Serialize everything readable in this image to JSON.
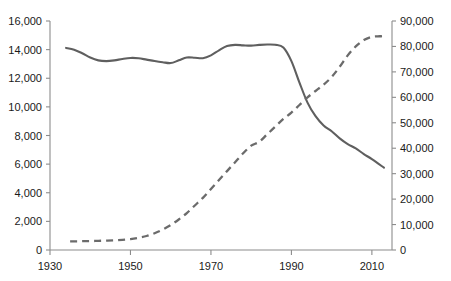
{
  "chart_data": {
    "type": "line",
    "title": "",
    "subtitle": "",
    "xlabel": "",
    "ylabel": "",
    "grid": false,
    "legend": "none",
    "xlim": [
      1930,
      2015
    ],
    "x_ticks": [
      "1930",
      "1950",
      "1970",
      "1990",
      "2010"
    ],
    "x_tick_values": [
      1930,
      1950,
      1970,
      1990,
      2010
    ],
    "axes": {
      "left": {
        "label": "",
        "ylim": [
          0,
          16000
        ],
        "ticks": [
          "0",
          "2,000",
          "4,000",
          "6,000",
          "8,000",
          "10,000",
          "12,000",
          "14,000",
          "16,000"
        ],
        "tick_values": [
          0,
          2000,
          4000,
          6000,
          8000,
          10000,
          12000,
          14000,
          16000
        ]
      },
      "right": {
        "label": "",
        "ylim": [
          0,
          90000
        ],
        "ticks": [
          "0",
          "10,000",
          "20,000",
          "30,000",
          "40,000",
          "50,000",
          "60,000",
          "70,000",
          "80,000",
          "90,000"
        ],
        "tick_values": [
          0,
          10000,
          20000,
          30000,
          40000,
          50000,
          60000,
          70000,
          80000,
          90000
        ]
      }
    },
    "series": [
      {
        "name": "solid-series",
        "style": "solid",
        "axis": "left",
        "color": "#5f5f5f",
        "x": [
          1934,
          1936,
          1938,
          1940,
          1942,
          1944,
          1946,
          1948,
          1950,
          1952,
          1954,
          1956,
          1958,
          1960,
          1962,
          1964,
          1966,
          1968,
          1970,
          1972,
          1974,
          1976,
          1978,
          1980,
          1982,
          1984,
          1986,
          1988,
          1990,
          1992,
          1994,
          1996,
          1998,
          2000,
          2002,
          2004,
          2006,
          2008,
          2010,
          2013
        ],
        "values": [
          14120,
          14000,
          13750,
          13450,
          13250,
          13200,
          13250,
          13350,
          13420,
          13400,
          13300,
          13200,
          13120,
          13060,
          13250,
          13450,
          13430,
          13400,
          13600,
          13950,
          14250,
          14330,
          14300,
          14280,
          14330,
          14360,
          14340,
          14150,
          13200,
          11700,
          10300,
          9350,
          8700,
          8300,
          7800,
          7400,
          7100,
          6700,
          6350,
          5750
        ]
      },
      {
        "name": "dashed-series",
        "style": "dashed",
        "axis": "right",
        "color": "#6b6b6b",
        "x": [
          1935,
          1938,
          1940,
          1942,
          1944,
          1946,
          1948,
          1950,
          1952,
          1954,
          1956,
          1958,
          1960,
          1962,
          1964,
          1966,
          1968,
          1970,
          1972,
          1974,
          1976,
          1978,
          1980,
          1982,
          1984,
          1986,
          1988,
          1990,
          1992,
          1994,
          1996,
          1998,
          2000,
          2002,
          2004,
          2006,
          2008,
          2010,
          2012,
          2013
        ],
        "values": [
          3400,
          3450,
          3500,
          3600,
          3700,
          3800,
          4000,
          4300,
          4800,
          5500,
          6600,
          8000,
          9800,
          12000,
          14500,
          17500,
          20500,
          24000,
          27500,
          31000,
          34500,
          38000,
          41000,
          42500,
          45500,
          48500,
          51500,
          54000,
          57000,
          60000,
          62500,
          65000,
          68000,
          72000,
          76500,
          80000,
          82500,
          83800,
          84000,
          84200
        ]
      }
    ],
    "annotations": {
      "crossover_year": 1993,
      "crossover_left_value": 9650,
      "crossover_right_value": 54000
    }
  }
}
